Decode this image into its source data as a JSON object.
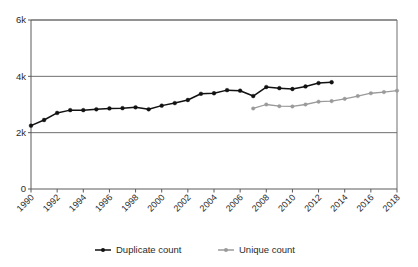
{
  "chart_data": {
    "type": "line",
    "title": "",
    "xlabel": "",
    "ylabel": "",
    "xlim": [
      1990,
      2018
    ],
    "ylim": [
      0,
      6000
    ],
    "grid": "horizontal",
    "legend_position": "bottom",
    "ytick_labels": [
      "0",
      "2k",
      "4k",
      "6k"
    ],
    "ytick_values": [
      0,
      2000,
      4000,
      6000
    ],
    "xtick_labels": [
      "1990",
      "1992",
      "1994",
      "1996",
      "1998",
      "2000",
      "2002",
      "2004",
      "2006",
      "2008",
      "2010",
      "2012",
      "2014",
      "2016",
      "2018"
    ],
    "xtick_values": [
      1990,
      1992,
      1994,
      1996,
      1998,
      2000,
      2002,
      2004,
      2006,
      2008,
      2010,
      2012,
      2014,
      2016,
      2018
    ],
    "series": [
      {
        "name": "Duplicate count",
        "color": "#111111",
        "marker": "circle",
        "x": [
          1990,
          1991,
          1992,
          1993,
          1994,
          1995,
          1996,
          1997,
          1998,
          1999,
          2000,
          2001,
          2002,
          2003,
          2004,
          2005,
          2006,
          2007,
          2008,
          2009,
          2010,
          2011,
          2012,
          2013
        ],
        "values": [
          2250,
          2450,
          2700,
          2800,
          2800,
          2830,
          2860,
          2870,
          2900,
          2830,
          2960,
          3050,
          3160,
          3380,
          3400,
          3510,
          3490,
          3300,
          3620,
          3580,
          3550,
          3640,
          3760,
          3790
        ]
      },
      {
        "name": "Unique count",
        "color": "#9a9a9a",
        "marker": "circle",
        "x": [
          2007,
          2008,
          2009,
          2010,
          2011,
          2012,
          2013,
          2014,
          2015,
          2016,
          2017,
          2018
        ],
        "values": [
          2860,
          3000,
          2940,
          2930,
          3000,
          3100,
          3120,
          3200,
          3300,
          3400,
          3440,
          3490
        ]
      }
    ]
  },
  "legend": {
    "items": [
      {
        "label": "Duplicate count",
        "color": "#111111"
      },
      {
        "label": "Unique count",
        "color": "#9a9a9a"
      }
    ]
  },
  "axes": {
    "y_axis_name": "count",
    "x_axis_name": "year"
  },
  "colors": {
    "duplicate": "#111111",
    "unique": "#9a9a9a",
    "gridline": "#6f6f6f",
    "axis": "#5a5a5a",
    "background": "#ffffff"
  }
}
